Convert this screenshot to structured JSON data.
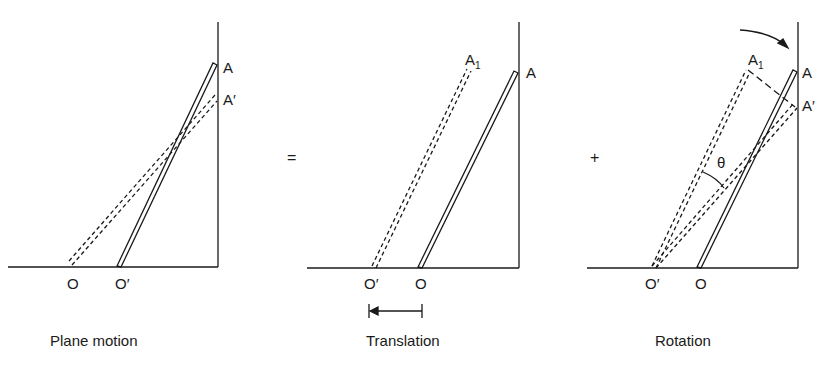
{
  "panels": [
    {
      "caption": "Plane motion",
      "labels": {
        "A": "A",
        "A_prime": "A′",
        "O": "O",
        "O_prime": "O′"
      }
    },
    {
      "caption": "Translation",
      "labels": {
        "A1": "A",
        "A1_sub": "1",
        "A": "A",
        "O_prime": "O′",
        "O": "O"
      }
    },
    {
      "caption": "Rotation",
      "labels": {
        "A1": "A",
        "A1_sub": "1",
        "A": "A",
        "A_prime": "A′",
        "theta": "θ",
        "O_prime": "O′",
        "O": "O"
      }
    }
  ],
  "operators": {
    "equals": "=",
    "plus": "+"
  }
}
